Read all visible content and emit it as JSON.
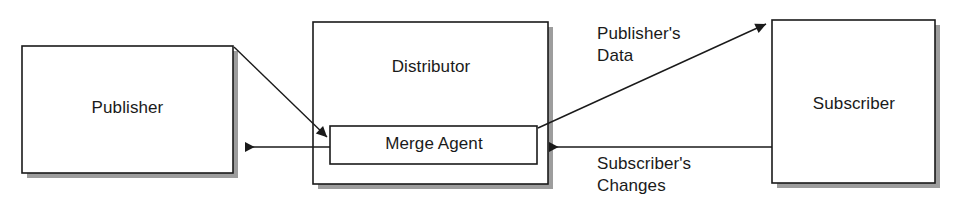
{
  "diagram": {
    "type": "block-flow-diagram",
    "background_color": "#ffffff",
    "line_color": "#1a1a1a",
    "shadow_color": "#9a9a9a",
    "nodes": {
      "publisher": {
        "label": "Publisher"
      },
      "distributor": {
        "label": "Distributor"
      },
      "merge_agent": {
        "label": "Merge Agent"
      },
      "subscriber": {
        "label": "Subscriber"
      }
    },
    "edges": {
      "publisher_to_merge_agent": {
        "label": ""
      },
      "merge_agent_to_publisher": {
        "label": ""
      },
      "merge_agent_to_subscriber": {
        "label": "Publisher's\nData"
      },
      "subscriber_to_merge_agent": {
        "label": "Subscriber's\nChanges"
      }
    },
    "edge_labels": {
      "publishers_data_line1": "Publisher's",
      "publishers_data_line2": "Data",
      "subscribers_changes_line1": "Subscriber's",
      "subscribers_changes_line2": "Changes"
    }
  }
}
